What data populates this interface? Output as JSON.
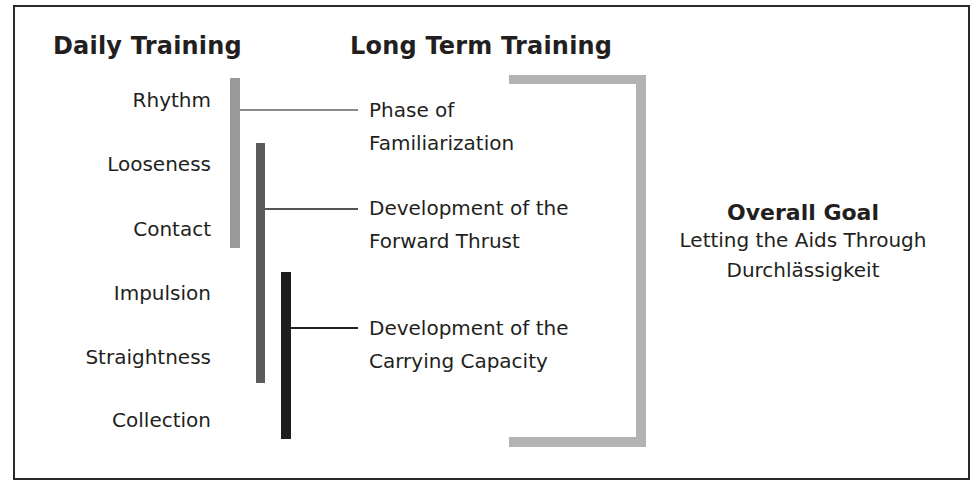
{
  "headings": {
    "daily": "Daily Training",
    "long_term": "Long Term Training"
  },
  "daily_items": [
    "Rhythm",
    "Looseness",
    "Contact",
    "Impulsion",
    "Straightness",
    "Collection"
  ],
  "phases": [
    {
      "line1": "Phase of",
      "line2": "Familiarization",
      "spans": [
        "Rhythm",
        "Looseness",
        "Contact"
      ],
      "bar_color": "#9a9a9a"
    },
    {
      "line1": "Development of the",
      "line2": "Forward Thrust",
      "spans": [
        "Looseness",
        "Contact",
        "Impulsion",
        "Straightness"
      ],
      "bar_color": "#5c5c5c"
    },
    {
      "line1": "Development of the",
      "line2": "Carrying Capacity",
      "spans": [
        "Impulsion",
        "Straightness",
        "Collection"
      ],
      "bar_color": "#1e1e1e"
    }
  ],
  "goal": {
    "title": "Overall Goal",
    "line1": "Letting the Aids Through",
    "line2": "Durchlässigkeit"
  },
  "colors": {
    "bracket": "#b3b3b3",
    "connector": "#555555",
    "frame": "#2a2a2a"
  }
}
